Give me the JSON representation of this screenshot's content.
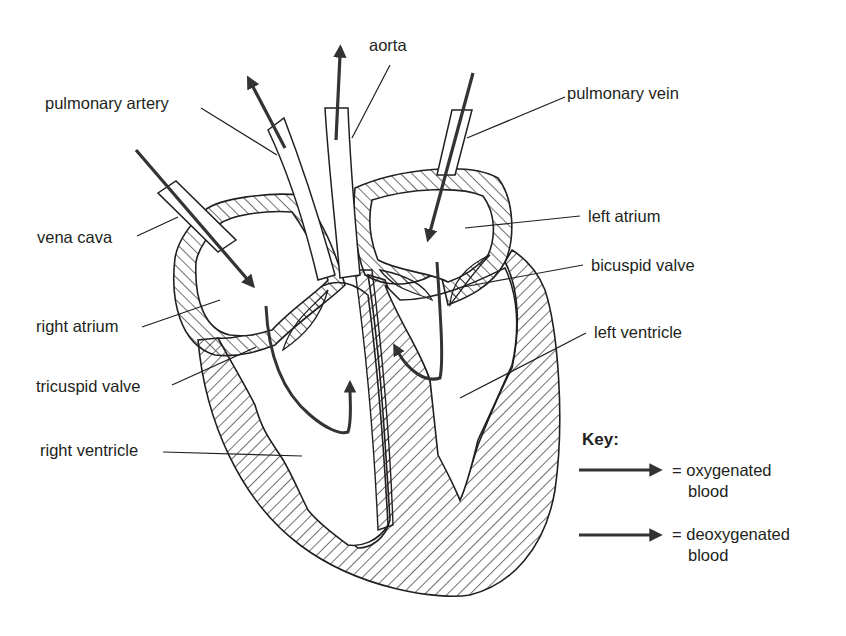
{
  "diagram": {
    "colors": {
      "ink": "#231f20",
      "background": "#ffffff",
      "arrow": "#333333"
    },
    "labels": {
      "aorta": "aorta",
      "pulmonary_artery": "pulmonary artery",
      "pulmonary_vein": "pulmonary vein",
      "vena_cava": "vena cava",
      "left_atrium": "left atrium",
      "bicuspid_valve": "bicuspid valve",
      "right_atrium": "right atrium",
      "left_ventricle": "left ventricle",
      "tricuspid_valve": "tricuspid valve",
      "right_ventricle": "right ventricle"
    },
    "key": {
      "title": "Key:",
      "items": [
        {
          "symbol": "arrow-right",
          "text_line1": "= oxygenated",
          "text_line2": "blood"
        },
        {
          "symbol": "arrow-right",
          "text_line1": "= deoxygenated",
          "text_line2": "blood"
        }
      ]
    }
  }
}
